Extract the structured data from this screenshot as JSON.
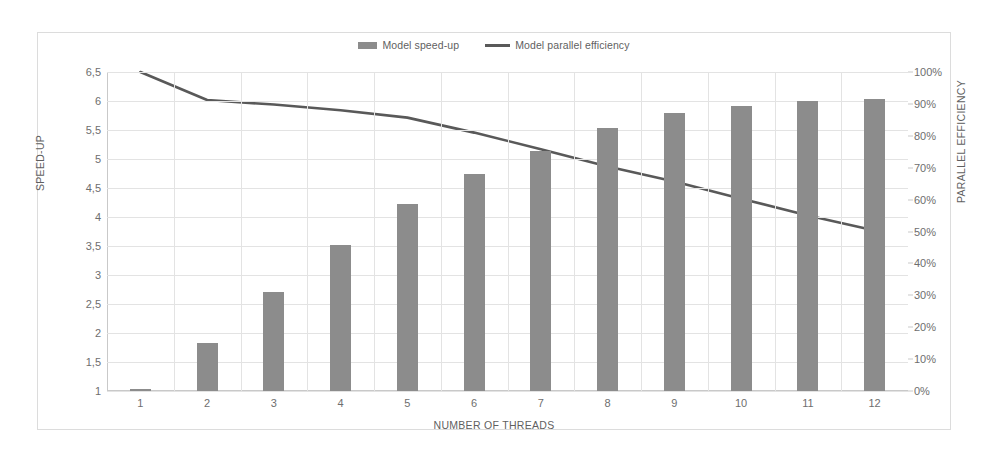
{
  "chart_data": {
    "type": "bar",
    "title": "",
    "xlabel": "NUMBER OF THREADS",
    "ylabel": "SPEED-UP",
    "y2label": "PARALLEL EFFICIENCY",
    "categories": [
      "1",
      "2",
      "3",
      "4",
      "5",
      "6",
      "7",
      "8",
      "9",
      "10",
      "11",
      "12"
    ],
    "ylim": [
      1,
      6.5
    ],
    "y2lim": [
      0,
      100
    ],
    "grid": true,
    "legend_position": "top-center",
    "series": [
      {
        "name": "Model speed-up",
        "type": "bar",
        "axis": "left",
        "color": "#8c8c8c",
        "values": [
          1.02,
          1.83,
          2.7,
          3.52,
          4.23,
          4.75,
          5.13,
          5.53,
          5.79,
          5.91,
          6.0,
          6.03
        ]
      },
      {
        "name": "Model parallel efficiency",
        "type": "line",
        "axis": "right",
        "color": "#595959",
        "values": [
          100,
          91.2,
          89.8,
          88.0,
          85.7,
          81.0,
          75.8,
          70.4,
          65.7,
          60.3,
          55.0,
          50.3
        ]
      }
    ],
    "yticks_left": [
      "1",
      "1,5",
      "2",
      "2,5",
      "3",
      "3,5",
      "4",
      "4,5",
      "5",
      "5,5",
      "6",
      "6,5"
    ],
    "yticks_left_values": [
      1,
      1.5,
      2,
      2.5,
      3,
      3.5,
      4,
      4.5,
      5,
      5.5,
      6,
      6.5
    ],
    "yticks_right": [
      "0%",
      "10%",
      "20%",
      "30%",
      "40%",
      "50%",
      "60%",
      "70%",
      "80%",
      "90%",
      "100%"
    ],
    "yticks_right_values": [
      0,
      10,
      20,
      30,
      40,
      50,
      60,
      70,
      80,
      90,
      100
    ]
  },
  "legend": {
    "items": [
      {
        "label": "Model speed-up",
        "marker": "bar-swatch"
      },
      {
        "label": "Model parallel efficiency",
        "marker": "line-swatch"
      }
    ]
  }
}
